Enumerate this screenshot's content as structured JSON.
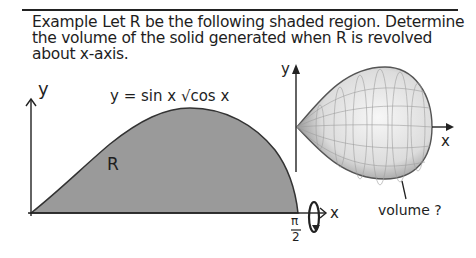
{
  "problem": {
    "lead": "Example",
    "text": "Let R be the following shaded region. Determine the volume of the solid generated when R is revolved about x-axis."
  },
  "left_plot": {
    "y_axis_label": "y",
    "x_axis_label": "x",
    "equation": "y = sin x √cos x",
    "region_label": "R",
    "x_end_label_num": "π",
    "x_end_label_den": "2",
    "region_color": "#9a9a9a"
  },
  "right_plot": {
    "y_axis_label": "y",
    "x_axis_label": "x",
    "annotation": "volume ?"
  }
}
